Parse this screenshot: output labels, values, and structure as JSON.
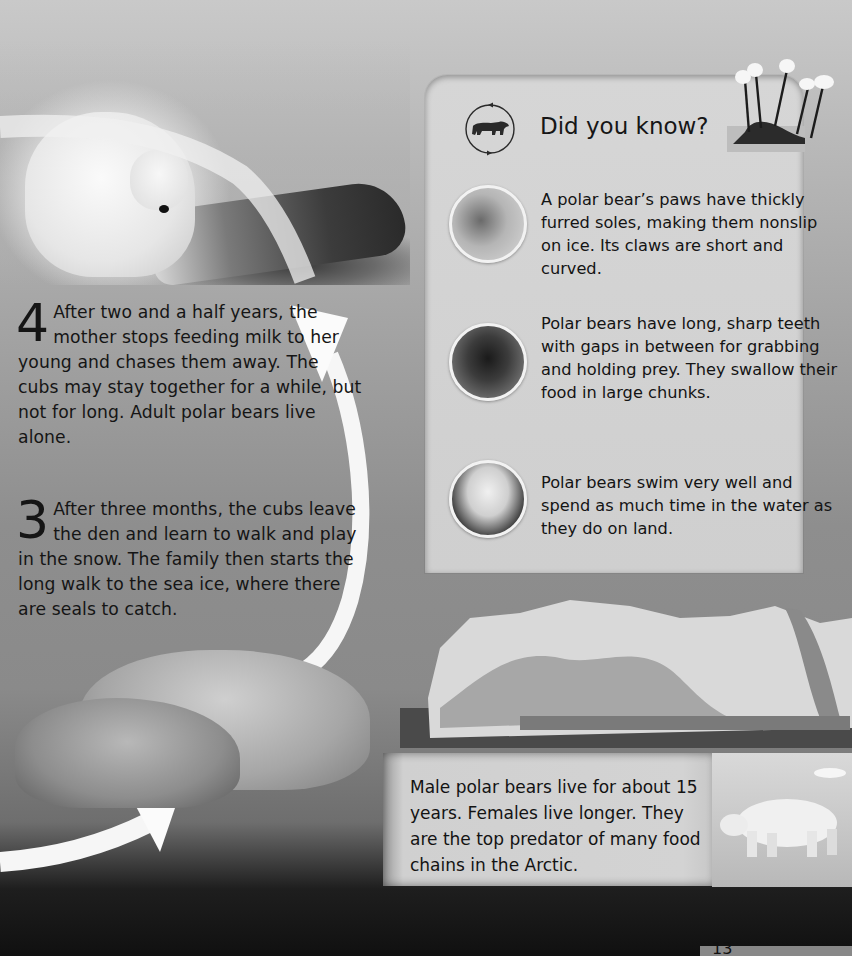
{
  "steps": [
    {
      "number": "4",
      "text": "After two and a half years, the mother stops feeding milk to her young and chases them away. The cubs may stay together for a while, but not for long. Adult polar bears live alone."
    },
    {
      "number": "3",
      "text": "After three months, the cubs leave the den and learn to walk and play in the snow. The family then starts the long walk to the sea ice, where there are seals to catch."
    }
  ],
  "did_you_know": {
    "icon": "polar-bear-cycle-icon",
    "title": "Did you know?",
    "facts": [
      {
        "image": "paw-photo",
        "text": "A polar bear’s paws have thickly furred soles, making them nonslip on ice. Its claws are short and curved."
      },
      {
        "image": "teeth-photo",
        "text": "Polar bears have long, sharp teeth with gaps in between for grabbing and holding prey. They swallow their food in large chunks."
      },
      {
        "image": "swimming-bear-photo",
        "text": "Polar bears swim very well and spend as much time in the water as they do on land."
      }
    ]
  },
  "lifespan_box": {
    "text": "Male polar bears live for about 15 years. Females live longer. They are the top predator of many food chains in the Arctic."
  },
  "page": {
    "number": "13"
  },
  "colors": {
    "arrow": "#ffffff",
    "card_bg": "#d3d3d3",
    "text": "#141414"
  }
}
